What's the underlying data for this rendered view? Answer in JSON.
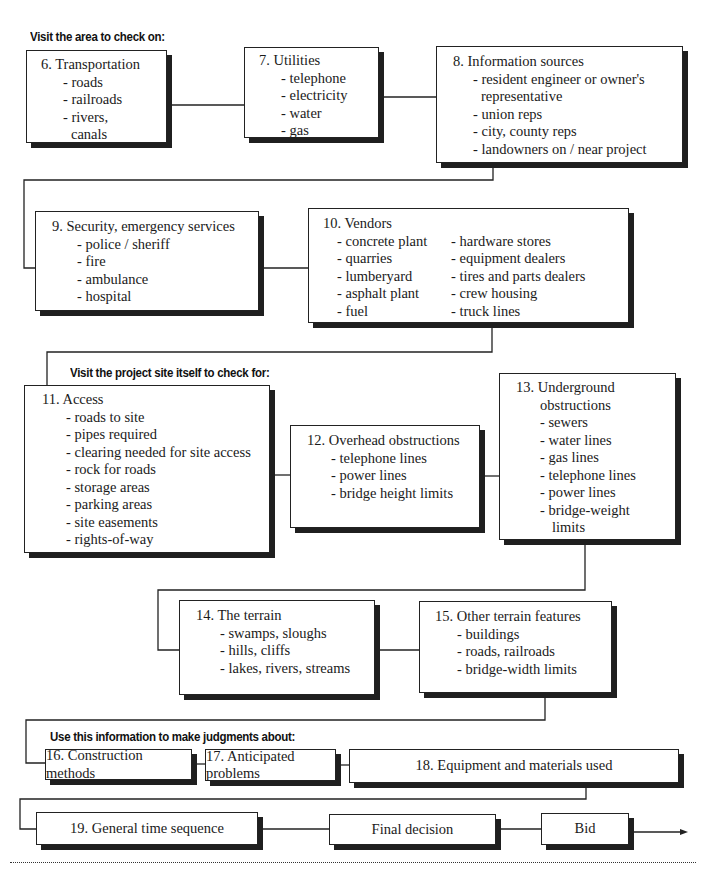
{
  "sections": {
    "area_heading": "Visit the area to check on:",
    "site_heading": "Visit the project site itself to check for:",
    "judgment_heading": "Use this information to make judgments about:"
  },
  "boxes": {
    "b6": {
      "title": "6.  Transportation",
      "items": [
        "- roads",
        "- railroads",
        "- rivers,",
        "  canals"
      ]
    },
    "b7": {
      "title": "7.  Utilities",
      "items": [
        "- telephone",
        "- electricity",
        "- water",
        "- gas"
      ]
    },
    "b8": {
      "title": "8.  Information sources",
      "items": [
        "- resident engineer or owner's",
        "  representative",
        "- union reps",
        "- city, county reps",
        "- landowners on / near project"
      ]
    },
    "b9": {
      "title": "9.  Security, emergency services",
      "items": [
        "- police / sheriff",
        "- fire",
        "- ambulance",
        "- hospital"
      ]
    },
    "b10": {
      "title": "10.  Vendors",
      "col1": [
        "- concrete plant",
        "- quarries",
        "- lumberyard",
        "- asphalt plant",
        "- fuel"
      ],
      "col2": [
        "- hardware stores",
        "- equipment dealers",
        "- tires and parts dealers",
        "- crew housing",
        "- truck lines"
      ]
    },
    "b11": {
      "title": "11.  Access",
      "items": [
        "- roads to site",
        "- pipes required",
        "- clearing needed for site access",
        "- rock for roads",
        "- storage areas",
        "- parking areas",
        "- site easements",
        "- rights-of-way"
      ]
    },
    "b12": {
      "title": "12.  Overhead obstructions",
      "items": [
        "- telephone lines",
        "- power lines",
        "- bridge height limits"
      ]
    },
    "b13": {
      "title": "13.  Underground",
      "title2": "obstructions",
      "items": [
        "- sewers",
        "- water lines",
        "- gas lines",
        "- telephone lines",
        "- power lines",
        "- bridge-weight",
        "  limits"
      ]
    },
    "b14": {
      "title": "14.  The terrain",
      "items": [
        "- swamps, sloughs",
        "- hills, cliffs",
        "- lakes, rivers, streams"
      ]
    },
    "b15": {
      "title": "15.  Other terrain features",
      "items": [
        "- buildings",
        "- roads, railroads",
        "- bridge-width limits"
      ]
    },
    "b16": {
      "title": "16.  Construction methods"
    },
    "b17": {
      "title": "17.  Anticipated problems"
    },
    "b18": {
      "title": "18.  Equipment and materials used"
    },
    "b19": {
      "title": "19.  General time sequence"
    },
    "final": {
      "title": "Final decision"
    },
    "bid": {
      "title": "Bid"
    }
  },
  "colors": {
    "line": "#222222",
    "shadow": "#1f1f1f",
    "background": "#ffffff"
  }
}
